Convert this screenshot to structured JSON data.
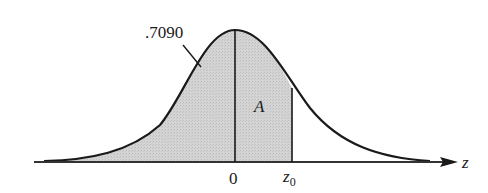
{
  "diagram": {
    "curve": "standard normal density",
    "shaded_region": "from -infinity to z0",
    "labels": {
      "left_area": ".7090",
      "region_A": "A",
      "origin": "0",
      "z0_main": "z",
      "z0_sub": "0",
      "axis": "z"
    },
    "colors": {
      "fill": "#cfcfcf",
      "stroke": "#1a1a1a"
    }
  }
}
